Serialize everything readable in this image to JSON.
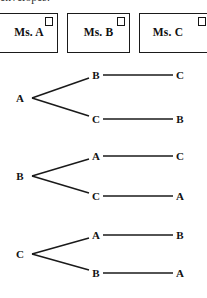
{
  "caption": {
    "text": "envelopes."
  },
  "envelopes": {
    "items": [
      {
        "name": "Ms. A",
        "stamp": "stamp-square-icon"
      },
      {
        "name": "Ms. B",
        "stamp": "stamp-square-icon"
      },
      {
        "name": "Ms. C",
        "stamp": "stamp-square-icon"
      }
    ]
  },
  "diagram": {
    "type": "tree",
    "colors": {
      "line": "#1a1a1a",
      "text": "#121212",
      "background": "#ffffff"
    },
    "groups": [
      {
        "root": "A",
        "root_x": 20,
        "root_y": 98,
        "branches": [
          {
            "mid": "B",
            "mid_x": 96,
            "mid_y": 75,
            "end": "C",
            "end_x": 180,
            "end_y": 75
          },
          {
            "mid": "C",
            "mid_x": 96,
            "mid_y": 119,
            "end": "B",
            "end_x": 180,
            "end_y": 119
          }
        ]
      },
      {
        "root": "B",
        "root_x": 20,
        "root_y": 176,
        "branches": [
          {
            "mid": "A",
            "mid_x": 96,
            "mid_y": 156,
            "end": "C",
            "end_x": 180,
            "end_y": 156
          },
          {
            "mid": "C",
            "mid_x": 96,
            "mid_y": 196,
            "end": "A",
            "end_x": 180,
            "end_y": 196
          }
        ]
      },
      {
        "root": "C",
        "root_x": 20,
        "root_y": 254,
        "branches": [
          {
            "mid": "A",
            "mid_x": 96,
            "mid_y": 235,
            "end": "B",
            "end_x": 180,
            "end_y": 235
          },
          {
            "mid": "B",
            "mid_x": 96,
            "mid_y": 273,
            "end": "A",
            "end_x": 180,
            "end_y": 273
          }
        ]
      }
    ]
  }
}
